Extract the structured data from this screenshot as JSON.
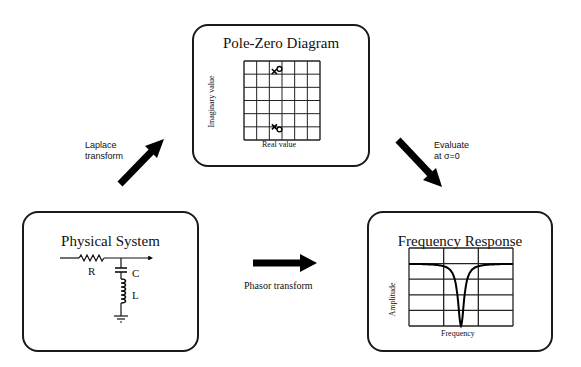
{
  "pole_zero": {
    "title": "Pole-Zero Diagram",
    "x_label": "Real value",
    "y_label": "Imaginary value",
    "grid": {
      "cols": 6,
      "rows": 6
    },
    "poles": [
      {
        "re": 2.4,
        "im": 5.2
      },
      {
        "re": 2.4,
        "im": 1.0
      }
    ],
    "zeros": [
      {
        "re": 2.8,
        "im": 5.4
      },
      {
        "re": 2.8,
        "im": 0.8
      }
    ]
  },
  "physical_system": {
    "title": "Physical System",
    "components": {
      "resistor": "R",
      "capacitor": "C",
      "inductor": "L"
    }
  },
  "frequency_response": {
    "title": "Frequency Response",
    "x_label": "Frequency",
    "y_label": "Amplitude",
    "grid": {
      "cols": 3,
      "rows": 5
    },
    "curve": {
      "type": "notch",
      "passband_level": 0.8,
      "notch_center": 0.5,
      "notch_depth": 0.0
    }
  },
  "arrows": {
    "laplace": {
      "label_line1": "Laplace",
      "label_line2": "transform"
    },
    "evaluate": {
      "label_line1": "Evaluate",
      "label_line2": "at σ=0"
    },
    "phasor": {
      "label": "Phasor transform"
    }
  }
}
